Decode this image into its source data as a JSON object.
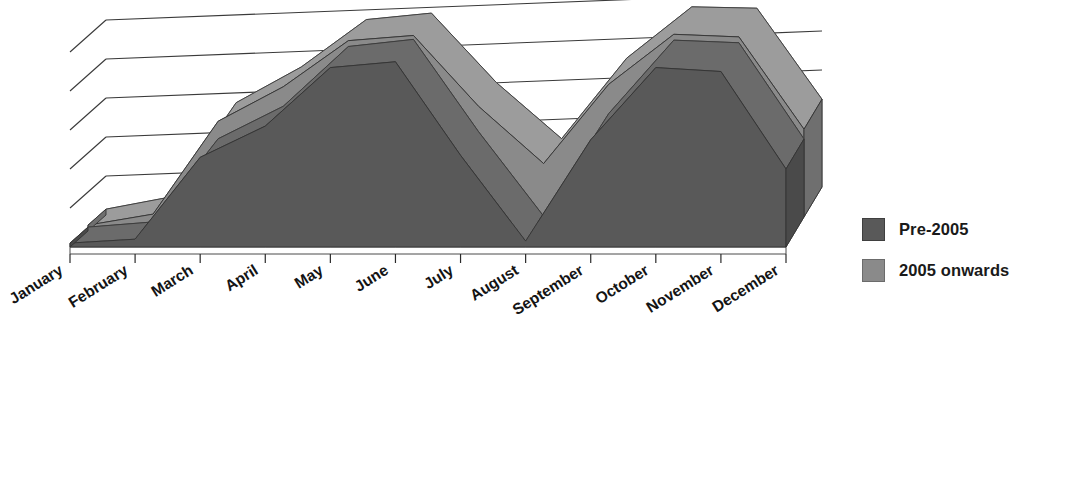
{
  "chart_data": {
    "type": "area",
    "subtype": "3d-area-surface",
    "title": "",
    "xlabel": "",
    "ylabel": "",
    "grid": true,
    "gridlines": 5,
    "y_tick_labels": [],
    "ylim": [
      0,
      100
    ],
    "legend_position": "right",
    "categories": [
      "January",
      "February",
      "March",
      "April",
      "May",
      "June",
      "July",
      "August",
      "September",
      "October",
      "November",
      "December"
    ],
    "series": [
      {
        "name": "Pre-2005",
        "color": "#595959",
        "values": [
          2,
          4,
          46,
          62,
          92,
          95,
          47,
          3,
          55,
          92,
          90,
          40
        ]
      },
      {
        "name": "2005 onwards",
        "color": "#8a8a8a",
        "values": [
          3,
          8,
          55,
          72,
          95,
          97,
          60,
          30,
          70,
          95,
          93,
          45
        ]
      }
    ]
  },
  "axis": {
    "categories": [
      "January",
      "February",
      "March",
      "April",
      "May",
      "June",
      "July",
      "August",
      "September",
      "October",
      "November",
      "December"
    ],
    "label_rotation_deg": -32
  },
  "legend": {
    "items": [
      {
        "label": "Pre-2005",
        "color": "#595959"
      },
      {
        "label": "2005 onwards",
        "color": "#8a8a8a"
      }
    ]
  },
  "colors": {
    "series_front": "#595959",
    "series_back": "#8a8a8a",
    "series_front_side": "#4a4a4a",
    "series_back_side": "#6f6f6f",
    "series_front_top": "#6b6b6b",
    "series_back_top": "#9c9c9c",
    "gridline": "#3a3a3a",
    "floor": "#ffffff",
    "text": "#141414"
  }
}
